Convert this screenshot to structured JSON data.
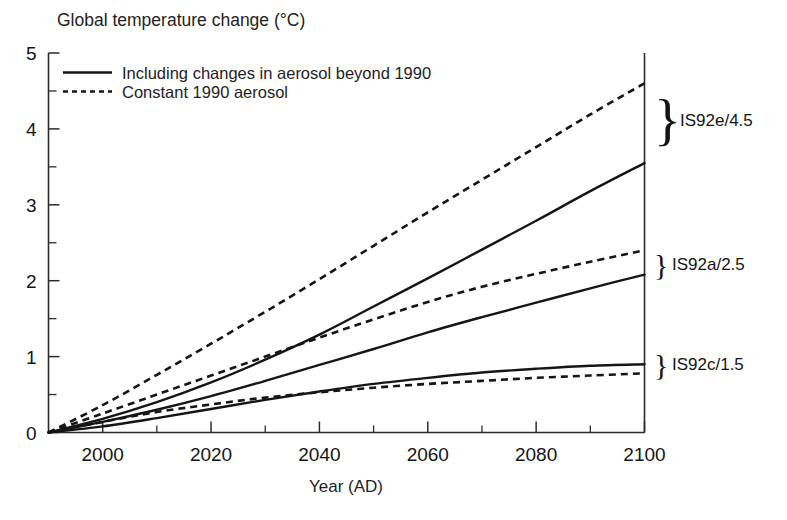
{
  "chart_data": {
    "type": "line",
    "title": "Global temperature change (°C)",
    "xlabel": "Year (AD)",
    "ylabel": "Global temperature change (°C)",
    "xlim": [
      1990,
      2100
    ],
    "ylim": [
      0,
      5
    ],
    "grid": false,
    "legend_position": "top-left",
    "x_ticks": [
      "2000",
      "2020",
      "2040",
      "2060",
      "2080",
      "2100"
    ],
    "x_tick_values": [
      2000,
      2020,
      2040,
      2060,
      2080,
      2100
    ],
    "x_minor_step": 10,
    "y_ticks": [
      "0",
      "1",
      "2",
      "3",
      "4",
      "5"
    ],
    "y_tick_values": [
      0,
      1,
      2,
      3,
      4,
      5
    ],
    "y_minor_step": 0.5,
    "legend": [
      {
        "key": "solid",
        "label": "Including changes in aerosol beyond 1990",
        "style": "solid"
      },
      {
        "key": "dashed",
        "label": "Constant 1990 aerosol",
        "style": "dashed"
      }
    ],
    "annotations": [
      {
        "label": "IS92e/4.5",
        "brace": "}",
        "pair": "IS92e",
        "y_center": 4.05
      },
      {
        "label": "IS92a/2.5",
        "brace": "}",
        "pair": "IS92a",
        "y_center": 2.25
      },
      {
        "label": "IS92c/1.5",
        "brace": "}",
        "pair": "IS92c",
        "y_center": 0.84
      }
    ],
    "x": [
      1990,
      2000,
      2010,
      2020,
      2030,
      2040,
      2050,
      2060,
      2070,
      2080,
      2090,
      2100
    ],
    "series": [
      {
        "name": "IS92e constant 1990 aerosol",
        "scenario": "IS92e/4.5",
        "style": "dashed",
        "values": [
          0.0,
          0.36,
          0.76,
          1.17,
          1.59,
          2.02,
          2.46,
          2.9,
          3.33,
          3.76,
          4.19,
          4.6
        ]
      },
      {
        "name": "IS92e including changes in aerosol beyond 1990",
        "scenario": "IS92e/4.5",
        "style": "solid",
        "values": [
          0.0,
          0.18,
          0.4,
          0.66,
          0.96,
          1.29,
          1.66,
          2.03,
          2.41,
          2.79,
          3.18,
          3.55
        ]
      },
      {
        "name": "IS92a constant 1990 aerosol",
        "scenario": "IS92a/2.5",
        "style": "dashed",
        "values": [
          0.0,
          0.25,
          0.5,
          0.75,
          1.0,
          1.25,
          1.49,
          1.72,
          1.92,
          2.09,
          2.25,
          2.4
        ]
      },
      {
        "name": "IS92a including changes in aerosol beyond 1990",
        "scenario": "IS92a/2.5",
        "style": "solid",
        "values": [
          0.0,
          0.14,
          0.3,
          0.48,
          0.68,
          0.89,
          1.1,
          1.32,
          1.52,
          1.71,
          1.9,
          2.08
        ]
      },
      {
        "name": "IS92c constant 1990 aerosol",
        "scenario": "IS92c/1.5",
        "style": "dashed",
        "values": [
          0.0,
          0.14,
          0.27,
          0.37,
          0.46,
          0.53,
          0.59,
          0.64,
          0.68,
          0.72,
          0.75,
          0.78
        ]
      },
      {
        "name": "IS92c including changes in aerosol beyond 1990",
        "scenario": "IS92c/1.5",
        "style": "solid",
        "values": [
          0.0,
          0.08,
          0.19,
          0.31,
          0.43,
          0.54,
          0.64,
          0.72,
          0.79,
          0.84,
          0.88,
          0.9
        ]
      }
    ],
    "colors": {
      "line": "#151515",
      "axis": "#2b2b2b",
      "background": "#ffffff"
    }
  }
}
